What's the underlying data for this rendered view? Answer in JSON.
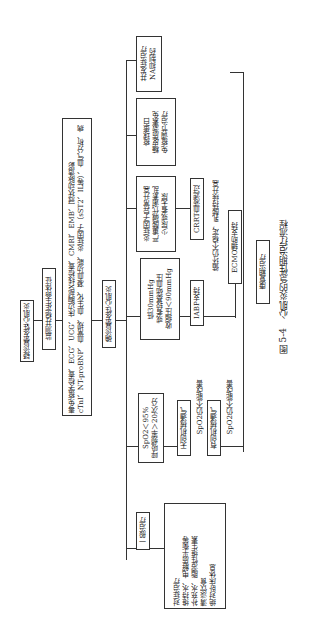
{
  "figure": {
    "caption_num": "图 5-4",
    "caption_text": "心肌炎的急性期治疗流程",
    "nodes": {
      "suspect": "疑诊暴发性心肌炎",
      "monitor": "监测并稳定生命体征",
      "tests": "cTnI、NT-proBNP、血常规、血生化、凝血功能、炎症因子（sST2、IL等）、血气分析、病毒免疫学检查、ECG、UCG、床边胸部X线检查、CMRI、EMB、冠状动脉造影",
      "confirm": "确诊暴发性心肌炎",
      "general": "一般治疗",
      "general_detail": "绝对卧床休息\n清淡饮食\n补充水、脂溶性维生素\n维持水、电解质平衡等\n对症治疗",
      "resp": "呼吸频率＞20次/分\nSpO2＜95%",
      "nippv": "无创机械通气",
      "ippv": "有创机械通气",
      "bp": "收缩压＜90mmHg\n或者较基础血压\n低30mmHg",
      "iabp": "IABP支持",
      "oliguria": "少尿或者无尿\n严重酸碱代谢紊乱\n炎症因子异常升高",
      "crrt": "CRRT血液滤过",
      "immune": "免疫调节治疗\n糖皮质激素免\n疫球蛋白",
      "na": "NA抑制药\n并发症治疗",
      "ecmo": "ECMO辅助支持",
      "recovery": "康复期治疗"
    },
    "labels": {
      "spo2_fail_1": "SpO2仍不能改善",
      "spo2_fail_2": "SpO2仍不能改善",
      "circ_fail": "循环仍不稳定，乳酸持续升高"
    }
  }
}
